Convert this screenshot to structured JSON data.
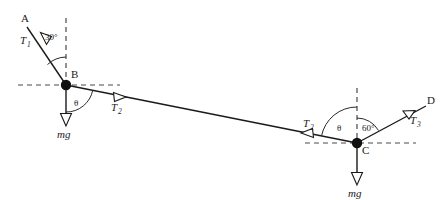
{
  "diagram": {
    "colors": {
      "stroke": "#1a1a1a",
      "dashed": "#4a4a4a",
      "node": "#101010",
      "background": "#ffffff",
      "arrowhead_fill": "#ffffff"
    },
    "points": [
      {
        "id": "A",
        "label": "A",
        "x": 26,
        "y": 22,
        "kind": "anchor-endpoint"
      },
      {
        "id": "B",
        "label": "B",
        "x": 66,
        "y": 85,
        "kind": "mass-node"
      },
      {
        "id": "C",
        "label": "C",
        "x": 357,
        "y": 143,
        "kind": "mass-node"
      },
      {
        "id": "D",
        "label": "D",
        "x": 429,
        "y": 104,
        "kind": "anchor-endpoint"
      }
    ],
    "forces": [
      {
        "id": "T1",
        "label": "T",
        "sub": "1",
        "at": "B",
        "direction": "up-left toward A",
        "arrow": "outward"
      },
      {
        "id": "T2_left",
        "label": "T",
        "sub": "2",
        "at": "B",
        "direction": "down-right toward C",
        "arrow": "outward"
      },
      {
        "id": "T2_right",
        "label": "T",
        "sub": "2",
        "at": "C",
        "direction": "up-left toward B",
        "arrow": "outward"
      },
      {
        "id": "T3",
        "label": "T",
        "sub": "3",
        "at": "C",
        "direction": "up-right toward D",
        "arrow": "outward"
      },
      {
        "id": "mg_B",
        "label": "mg",
        "at": "B",
        "direction": "straight down",
        "arrow": "outward"
      },
      {
        "id": "mg_C",
        "label": "mg",
        "at": "C",
        "direction": "straight down",
        "arrow": "outward"
      }
    ],
    "angles": [
      {
        "id": "angle-30",
        "label": "30",
        "unit": "°",
        "at": "B",
        "between": "BA segment and upward vertical dashed line"
      },
      {
        "id": "angle-theta-B",
        "label": "θ",
        "at": "B",
        "between": "downward mg vector and BC cable"
      },
      {
        "id": "angle-theta-C",
        "label": "θ",
        "at": "C",
        "between": "CB cable and upward vertical dashed line"
      },
      {
        "id": "angle-60",
        "label": "60",
        "unit": "°",
        "at": "C",
        "between": "upward vertical dashed line and CD segment"
      }
    ],
    "labels": {
      "A": "A",
      "B": "B",
      "C": "C",
      "D": "D",
      "T": "T",
      "sub1": "1",
      "sub2": "2",
      "sub3": "3",
      "mg": "mg",
      "theta": "θ",
      "deg30": "30°",
      "deg60": "60°"
    },
    "guides": [
      {
        "id": "vertical-dashed-B",
        "at": "B",
        "orientation": "vertical",
        "extent": "above node"
      },
      {
        "id": "horizontal-dashed-B",
        "at": "B",
        "orientation": "horizontal",
        "extent": "both sides"
      },
      {
        "id": "vertical-dashed-C",
        "at": "C",
        "orientation": "vertical",
        "extent": "above node"
      },
      {
        "id": "horizontal-dashed-C",
        "at": "C",
        "orientation": "horizontal",
        "extent": "both sides"
      }
    ]
  }
}
